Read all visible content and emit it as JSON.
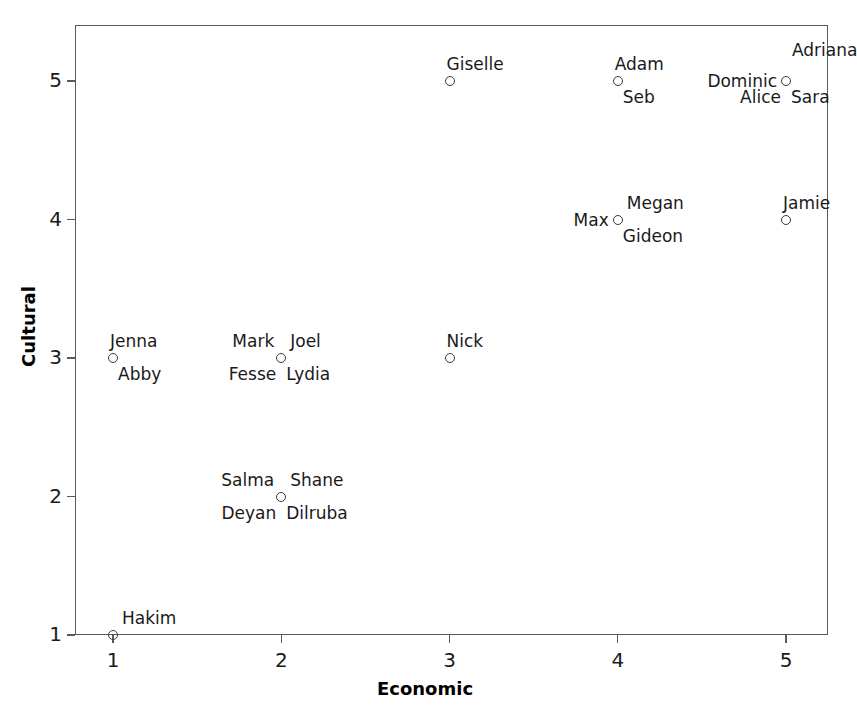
{
  "chart_data": {
    "type": "scatter",
    "title": "",
    "xlabel": "Economic",
    "ylabel": "Cultural",
    "xlim": [
      0.75,
      5.3
    ],
    "ylim": [
      0.92,
      5.35
    ],
    "xticks": [
      "1",
      "2",
      "3",
      "4",
      "5"
    ],
    "yticks": [
      "1",
      "2",
      "3",
      "4",
      "5"
    ],
    "xtick_values": [
      1,
      2,
      3,
      4,
      5
    ],
    "ytick_values": [
      1,
      2,
      3,
      4,
      5
    ],
    "grid": false,
    "legend": null,
    "marker": "open-circle",
    "marker_color": "#3a3a3a",
    "points": [
      {
        "x": 3,
        "y": 5,
        "labels": [
          {
            "text": "Giselle",
            "pos": "above"
          }
        ]
      },
      {
        "x": 4,
        "y": 5,
        "labels": [
          {
            "text": "Adam",
            "pos": "above"
          },
          {
            "text": "Seb",
            "pos": "below-right"
          }
        ]
      },
      {
        "x": 5,
        "y": 5,
        "labels": [
          {
            "text": "Adriana",
            "pos": "above-far-right"
          },
          {
            "text": "Dominic",
            "pos": "left"
          },
          {
            "text": "Alice",
            "pos": "below-left"
          },
          {
            "text": "Sara",
            "pos": "below-right"
          }
        ]
      },
      {
        "x": 4,
        "y": 4,
        "labels": [
          {
            "text": "Megan",
            "pos": "above-right"
          },
          {
            "text": "Max",
            "pos": "left"
          },
          {
            "text": "Gideon",
            "pos": "below-right"
          }
        ]
      },
      {
        "x": 5,
        "y": 4,
        "labels": [
          {
            "text": "Jamie",
            "pos": "above"
          }
        ]
      },
      {
        "x": 1,
        "y": 3,
        "labels": [
          {
            "text": "Jenna",
            "pos": "above"
          },
          {
            "text": "Abby",
            "pos": "below-right"
          }
        ]
      },
      {
        "x": 2,
        "y": 3,
        "labels": [
          {
            "text": "Mark",
            "pos": "above-left"
          },
          {
            "text": "Joel",
            "pos": "above-right"
          },
          {
            "text": "Fesse",
            "pos": "below-left"
          },
          {
            "text": "Lydia",
            "pos": "below-right"
          }
        ]
      },
      {
        "x": 3,
        "y": 3,
        "labels": [
          {
            "text": "Nick",
            "pos": "above"
          }
        ]
      },
      {
        "x": 2,
        "y": 2,
        "labels": [
          {
            "text": "Salma",
            "pos": "above-left"
          },
          {
            "text": "Shane",
            "pos": "above-right"
          },
          {
            "text": "Deyan",
            "pos": "below-left"
          },
          {
            "text": "Dilruba",
            "pos": "below-right"
          }
        ]
      },
      {
        "x": 1,
        "y": 1,
        "labels": [
          {
            "text": "Hakim",
            "pos": "above-right"
          }
        ]
      }
    ]
  }
}
